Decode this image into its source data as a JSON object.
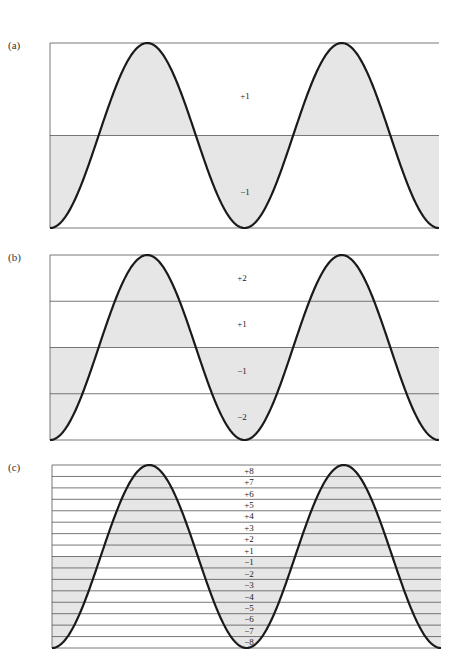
{
  "figure": {
    "colors": {
      "shade": "#e6e6e6",
      "curve": "#1a1a1a",
      "line": "#555555"
    },
    "panels": [
      {
        "label": "(a)",
        "levels": [
          "+1",
          "−1"
        ],
        "bands": 2
      },
      {
        "label": "(b)",
        "levels": [
          "+2",
          "+1",
          "−1",
          "−2"
        ],
        "bands": 4
      },
      {
        "label": "(c)",
        "levels": [
          "+8",
          "+7",
          "+6",
          "+5",
          "+4",
          "+3",
          "+2",
          "+1",
          "−1",
          "−2",
          "−3",
          "−4",
          "−5",
          "−6",
          "−7",
          "−8"
        ],
        "bands": 16
      }
    ]
  }
}
